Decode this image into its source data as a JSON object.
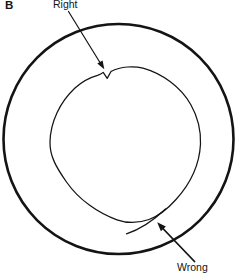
{
  "figure": {
    "panel_label": "B",
    "labels": {
      "right": "Right",
      "wrong": "Wrong"
    },
    "colors": {
      "ink": "#141414",
      "background": "#ffffff"
    }
  }
}
